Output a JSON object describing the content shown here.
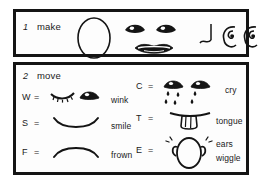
{
  "document": {
    "kind": "instruction-legend",
    "ink_color": "#141414",
    "paper_color": "#fdfdfd"
  },
  "sections": [
    {
      "number": "1",
      "title": "make",
      "icons": [
        {
          "name": "face-oval-icon",
          "meaning": "face outline"
        },
        {
          "name": "eyes-icon",
          "meaning": "eyes"
        },
        {
          "name": "lips-icon",
          "meaning": "mouth"
        },
        {
          "name": "nose-icon",
          "meaning": "nose"
        },
        {
          "name": "ear-left-icon",
          "meaning": "left ear"
        },
        {
          "name": "ear-right-icon",
          "meaning": "right ear"
        }
      ]
    },
    {
      "number": "2",
      "title": "move",
      "left_rows": [
        {
          "key": "W",
          "equals": "=",
          "label": "wink",
          "icon": "wink-eyes-icon"
        },
        {
          "key": "S",
          "equals": "=",
          "label": "smile",
          "icon": "smile-mouth-icon"
        },
        {
          "key": "F",
          "equals": "=",
          "label": "frown",
          "icon": "frown-mouth-icon"
        }
      ],
      "right_rows": [
        {
          "key": "C",
          "equals": "=",
          "label": "cry",
          "label2": "",
          "icon": "crying-eyes-icon"
        },
        {
          "key": "T",
          "equals": "=",
          "label": "tongue",
          "label2": "",
          "icon": "tongue-out-icon"
        },
        {
          "key": "E",
          "equals": "=",
          "label": "ears",
          "label2": "wiggle",
          "icon": "wiggle-ears-icon"
        }
      ]
    }
  ]
}
